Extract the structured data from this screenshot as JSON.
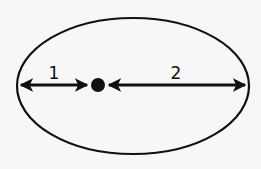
{
  "diagram": {
    "shape": "ellipse",
    "colors": {
      "background": "#f7f7f7",
      "stroke": "#111111"
    },
    "focus_point": {
      "description": "filled dot inside ellipse, off-center to the left"
    },
    "segments": [
      {
        "label": "1",
        "from": "left edge of ellipse",
        "to": "dot"
      },
      {
        "label": "2",
        "from": "dot",
        "to": "right edge of ellipse"
      }
    ]
  }
}
